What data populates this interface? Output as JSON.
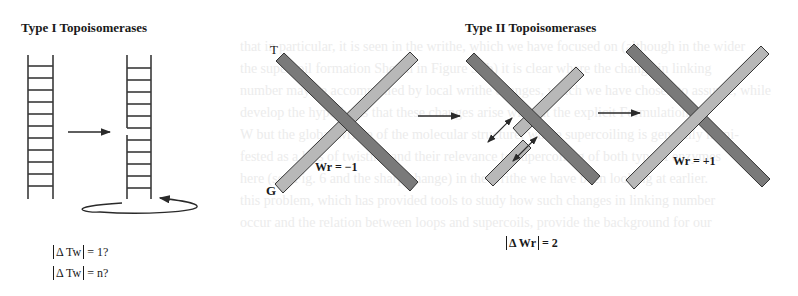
{
  "type1": {
    "title": "Type I Topoisomerases",
    "equation_1": {
      "quantity": "Δ Tw",
      "rhs": "= 1?"
    },
    "equation_2": {
      "quantity": "Δ Tw",
      "rhs": "= n?"
    }
  },
  "type2": {
    "title": "Type II Topoisomerases",
    "strand_labels": {
      "top": "T",
      "gate": "G"
    },
    "writhe_before": "Wr = −1",
    "writhe_after": "Wr = +1",
    "equation": {
      "quantity": "Δ Wr",
      "rhs": "= 2"
    }
  },
  "colors": {
    "t_strand": "#7a7a7a",
    "g_strand": "#b8b8b8",
    "outline": "#333333",
    "ladder": "#3a3a3a"
  },
  "ghost_text": [
    "that in particular, it is seen in the writhe, which we have focused on (although in the wider",
    "the supercoil formation Shown in Figure 5 (b) it is clear where the change in linking",
    "number may be accompanied by local writhe changes, which we have chosen to assume, while",
    "develop the hypothesis that these changes arise without the explicit Formulation of",
    "W but the global writhe of the molecular structure, where supercoiling is generally mani-",
    "fested as a loss of twisting and their relevance to supercoiling of both type II enzymes",
    "here (see Fig. 6 and the sharp change) in the writhe we have been looking at earlier.",
    "this problem, which has provided tools to study how such changes in linking number",
    "occur and the relation between loops and supercoils, provide the background for our"
  ]
}
